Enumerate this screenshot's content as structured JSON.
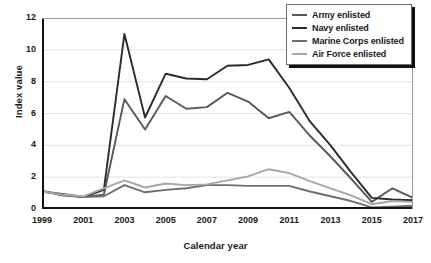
{
  "chart_data": {
    "type": "line",
    "title": "",
    "xlabel": "Calendar year",
    "ylabel": "Index value",
    "xlim": [
      1999,
      2017
    ],
    "ylim": [
      0,
      12
    ],
    "yticks": [
      0,
      2,
      4,
      6,
      8,
      10,
      12
    ],
    "xticks": [
      1999,
      2001,
      2003,
      2005,
      2007,
      2009,
      2011,
      2013,
      2015,
      2017
    ],
    "x": [
      1999,
      2000,
      2001,
      2002,
      2003,
      2004,
      2005,
      2006,
      2007,
      2008,
      2009,
      2010,
      2011,
      2012,
      2013,
      2014,
      2015,
      2016,
      2017
    ],
    "grid": "horizontal",
    "legend_position": "top-right",
    "series": [
      {
        "name": "Army enlisted",
        "color": "#585858",
        "values": [
          1.1,
          0.95,
          0.75,
          0.9,
          6.9,
          5.0,
          7.1,
          6.3,
          6.4,
          7.3,
          6.75,
          5.7,
          6.1,
          4.6,
          3.3,
          1.9,
          0.45,
          1.3,
          0.7
        ]
      },
      {
        "name": "Navy enlisted",
        "color": "#2b2b2b",
        "values": [
          1.1,
          0.9,
          0.75,
          1.2,
          11.0,
          5.75,
          8.5,
          8.2,
          8.15,
          9.0,
          9.05,
          9.4,
          7.6,
          5.5,
          4.0,
          2.3,
          0.7,
          0.6,
          0.55
        ]
      },
      {
        "name": "Marine Corps enlisted",
        "color": "#6e6e6e",
        "values": [
          1.15,
          0.85,
          0.75,
          0.8,
          1.5,
          1.05,
          1.2,
          1.3,
          1.5,
          1.5,
          1.45,
          1.45,
          1.45,
          1.1,
          0.8,
          0.5,
          0.1,
          0.15,
          0.2
        ]
      },
      {
        "name": "Air Force enlisted",
        "color": "#a6a6a6",
        "values": [
          1.1,
          0.9,
          0.8,
          1.3,
          1.8,
          1.35,
          1.6,
          1.5,
          1.55,
          1.8,
          2.05,
          2.5,
          2.25,
          1.75,
          1.3,
          0.85,
          0.3,
          0.5,
          0.45
        ]
      }
    ]
  },
  "axis": {
    "ytick_labels": [
      "0",
      "2",
      "4",
      "6",
      "8",
      "10",
      "12"
    ],
    "xtick_labels": [
      "1999",
      "2001",
      "2003",
      "2005",
      "2007",
      "2009",
      "2011",
      "2013",
      "2015",
      "2017"
    ],
    "y_title": "Index value",
    "x_title": "Calendar year"
  },
  "legend": {
    "items": [
      {
        "label": "Army enlisted",
        "color": "#585858"
      },
      {
        "label": "Navy enlisted",
        "color": "#2b2b2b"
      },
      {
        "label": "Marine Corps enlisted",
        "color": "#6e6e6e"
      },
      {
        "label": "Air Force enlisted",
        "color": "#a6a6a6"
      }
    ]
  },
  "colors": {
    "frame": "#111111",
    "grid": "#e2e2e2",
    "background": "#ffffff"
  }
}
